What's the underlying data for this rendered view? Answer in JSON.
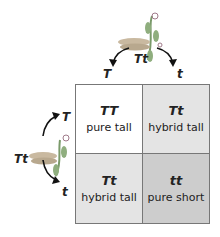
{
  "top_parent": {
    "genotype": "Tt",
    "gametes": [
      "T",
      "t"
    ]
  },
  "side_parent": {
    "genotype": "Tt",
    "gametes": [
      "T",
      "t"
    ]
  },
  "cells": [
    {
      "genotype": "TT",
      "phenotype": "pure tall",
      "color": "#ffffff"
    },
    {
      "genotype": "Tt",
      "phenotype": "hybrid tall",
      "color": "#e4e4e4"
    },
    {
      "genotype": "Tt",
      "phenotype": "hybrid tall",
      "color": "#e4e4e4"
    },
    {
      "genotype": "tt",
      "phenotype": "pure short",
      "color": "#cdcdcd"
    }
  ],
  "icons": {
    "plant": "pea-plant-icon",
    "arrow": "curved-arrow-icon"
  }
}
